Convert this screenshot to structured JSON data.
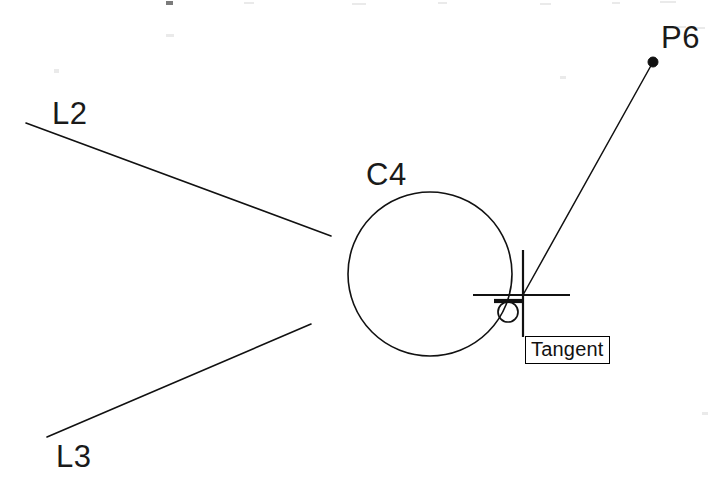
{
  "app": {
    "kind": "cad-drawing",
    "background_color": "#ffffff",
    "ink_color": "#111111",
    "width": 721,
    "height": 485
  },
  "labels": {
    "line_left_upper": "L2",
    "line_left_lower": "L3",
    "circle": "C4",
    "point": "P6"
  },
  "tooltip": {
    "text": "Tangent"
  },
  "osnap": {
    "marker_name": "tangent-osnap-marker",
    "marker_symbol": "circle-with-top-bar"
  },
  "geometry": {
    "line_l2": {
      "x1": 26,
      "y1": 123,
      "x2": 331,
      "y2": 236
    },
    "line_l3": {
      "x1": 47,
      "y1": 437,
      "x2": 311,
      "y2": 324
    },
    "circle_c4": {
      "cx": 430,
      "cy": 274,
      "r": 82
    },
    "rubber_band_line": {
      "x1": 523,
      "y1": 295,
      "x2": 653,
      "y2": 62
    },
    "point_p6": {
      "cx": 653,
      "cy": 62,
      "r": 5
    },
    "crosshair": {
      "cx": 523,
      "cy": 295,
      "h_x1": 473,
      "h_x2": 570,
      "v_y1": 250,
      "v_y2": 337
    },
    "tangent_marker": {
      "cx": 508,
      "cy": 312,
      "r": 10,
      "bar_x1": 494,
      "bar_x2": 524,
      "bar_y": 301
    }
  },
  "chart_data": {
    "type": "scatter",
    "title": "",
    "xlabel": "",
    "ylabel": "",
    "entities": [
      {
        "id": "L2",
        "type": "line",
        "from": [
          26,
          123
        ],
        "to": [
          331,
          236
        ]
      },
      {
        "id": "L3",
        "type": "line",
        "from": [
          47,
          437
        ],
        "to": [
          311,
          324
        ]
      },
      {
        "id": "C4",
        "type": "circle",
        "center": [
          430,
          274
        ],
        "radius": 82
      },
      {
        "id": "P6",
        "type": "point",
        "at": [
          653,
          62
        ]
      },
      {
        "id": "rubber-band",
        "type": "line",
        "from": [
          523,
          295
        ],
        "to": [
          653,
          62
        ]
      }
    ]
  }
}
